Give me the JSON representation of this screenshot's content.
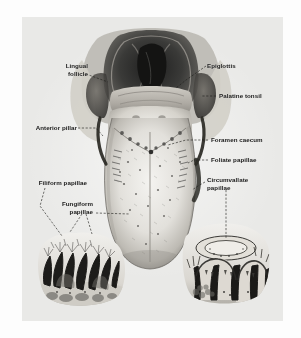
{
  "figure": {
    "background_color": "#e9e9e7",
    "ink_color": "#1b1b1b",
    "style": "halftone grayscale anatomical plate"
  },
  "labels": {
    "lingual_follicle": "Lingual\nfollicle",
    "epiglottis": "Epiglottis",
    "palatine_tonsil": "Palatine tonsil",
    "anterior_pillar": "Anterior pillar",
    "foramen_caecum": "Foramen caecum",
    "foliate_papillae": "Foliate papillae",
    "circumvallate_papillae": "Circumvallate\npapillae",
    "filiform_papillae": "Filiform papillae",
    "fungiform_papillae": "Fungiform\npapillae"
  },
  "structures": [
    {
      "name": "lingual-follicle",
      "label": "Lingual follicle",
      "side": "left"
    },
    {
      "name": "epiglottis",
      "label": "Epiglottis",
      "side": "right"
    },
    {
      "name": "palatine-tonsil",
      "label": "Palatine tonsil",
      "side": "right"
    },
    {
      "name": "anterior-pillar",
      "label": "Anterior pillar",
      "side": "left"
    },
    {
      "name": "foramen-caecum",
      "label": "Foramen caecum",
      "side": "right"
    },
    {
      "name": "foliate-papillae",
      "label": "Foliate papillae",
      "side": "right"
    },
    {
      "name": "circumvallate-papillae",
      "label": "Circumvallate papillae",
      "side": "right"
    },
    {
      "name": "filiform-papillae",
      "label": "Filiform papillae",
      "side": "left"
    },
    {
      "name": "fungiform-papillae",
      "label": "Fungiform papillae",
      "side": "left"
    }
  ],
  "insets": [
    {
      "name": "filiform-fungiform-section",
      "position": "bottom-left"
    },
    {
      "name": "circumvallate-section",
      "position": "bottom-right"
    }
  ]
}
